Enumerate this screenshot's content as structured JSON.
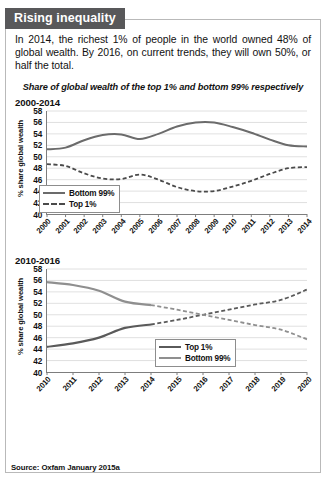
{
  "box": {
    "title": "Rising inequality",
    "title_bg": "#58585a",
    "lede": "In 2014, the richest 1% of people in the world owned 48% of global wealth. By 2016, on current trends, they will own 50%, or half the total.",
    "subtitle": "Share of global wealth of the top 1% and bottom 99% respectively",
    "source": "Source: Oxfam January 2015a"
  },
  "colors": {
    "bottom99_chart1": "#6b6b6b",
    "top1_chart1": "#4a4a4a",
    "top1_chart2": "#5a5a5a",
    "bottom99_chart2": "#8f8f8f",
    "axis": "#7d7d7d",
    "grid": "#d8d8d8"
  },
  "chart_data": [
    {
      "id": "chart-2000-2014",
      "type": "line",
      "title": "2000-2014",
      "xlabel": "",
      "ylabel": "% share global wealth",
      "ylim": [
        40,
        58
      ],
      "yticks": [
        40,
        42,
        44,
        46,
        48,
        50,
        52,
        54,
        56,
        58
      ],
      "grid": true,
      "legend_position": "bottom-left",
      "categories": [
        "2000",
        "2001",
        "2002",
        "2003",
        "2004",
        "2005",
        "2006",
        "2007",
        "2008",
        "2009",
        "2010",
        "2011",
        "2012",
        "2013",
        "2014"
      ],
      "series": [
        {
          "name": "Bottom 99%",
          "style": "solid",
          "color": "#6b6b6b",
          "values": [
            51.3,
            51.6,
            52.9,
            53.8,
            53.9,
            53.1,
            54.0,
            55.3,
            56.0,
            56.0,
            55.2,
            54.2,
            53.0,
            52.0,
            51.8
          ]
        },
        {
          "name": "Top 1%",
          "style": "dashed",
          "color": "#4a4a4a",
          "values": [
            48.7,
            48.4,
            47.1,
            46.2,
            46.1,
            46.9,
            46.0,
            44.7,
            44.0,
            44.0,
            44.8,
            45.8,
            47.0,
            48.0,
            48.2
          ]
        }
      ]
    },
    {
      "id": "chart-2010-2016",
      "type": "line",
      "title": "2010-2016",
      "xlabel": "",
      "ylabel": "% share global wealth",
      "ylim": [
        40,
        58
      ],
      "yticks": [
        40,
        42,
        44,
        46,
        48,
        50,
        52,
        54,
        56,
        58
      ],
      "grid": true,
      "legend_position": "bottom-center",
      "note": "solid segments are actuals to 2014; dashed segments are projections",
      "categories": [
        "2010",
        "2011",
        "2012",
        "2013",
        "2014",
        "2015",
        "2016",
        "2017",
        "2018",
        "2019",
        "2020"
      ],
      "series": [
        {
          "name": "Top 1%",
          "style": "solid-then-dashed",
          "dash_from": "2014",
          "color": "#5a5a5a",
          "values": [
            44.4,
            45.0,
            46.0,
            47.7,
            48.3,
            49.1,
            50.0,
            50.9,
            51.8,
            52.6,
            54.4
          ]
        },
        {
          "name": "Bottom 99%",
          "style": "solid-then-dashed",
          "dash_from": "2014",
          "color": "#8f8f8f",
          "values": [
            55.7,
            55.2,
            54.2,
            52.3,
            51.7,
            50.9,
            50.0,
            49.1,
            48.2,
            47.4,
            45.7
          ]
        }
      ]
    }
  ]
}
